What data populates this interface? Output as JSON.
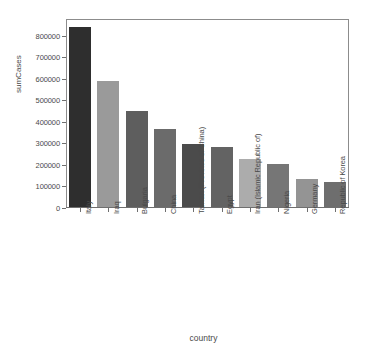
{
  "chart_data": {
    "type": "bar",
    "title": "",
    "subtitle": "",
    "xlabel": "country",
    "ylabel": "sumCases",
    "ylim": [
      0,
      880000
    ],
    "grid": false,
    "legend": null,
    "y_ticks": [
      0,
      100000,
      200000,
      300000,
      400000,
      500000,
      600000,
      700000,
      800000
    ],
    "y_tick_labels": [
      "0",
      "100000",
      "200000",
      "300000",
      "400000",
      "500000",
      "600000",
      "700000",
      "800000"
    ],
    "categories": [
      "Italy",
      "Iraq",
      "Bulgaria",
      "China",
      "Taiwan (Province of China)",
      "Egypt",
      "Iran (Islamic Republic of)",
      "Nigeria",
      "Germany",
      "Republic of Korea"
    ],
    "values": [
      845000,
      590000,
      452000,
      370000,
      297000,
      284000,
      229000,
      205000,
      136000,
      120000
    ],
    "bar_colors": [
      "#2e2e2e",
      "#9a9a9a",
      "#5e5e5e",
      "#6b6b6b",
      "#4b4b4b",
      "#636363",
      "#acacac",
      "#767676",
      "#949494",
      "#6e6e6e"
    ]
  },
  "axes": {
    "frame_color": "#8c8c8c",
    "tick_color": "#6f6f6f",
    "text_color": "#4a4a4a"
  }
}
